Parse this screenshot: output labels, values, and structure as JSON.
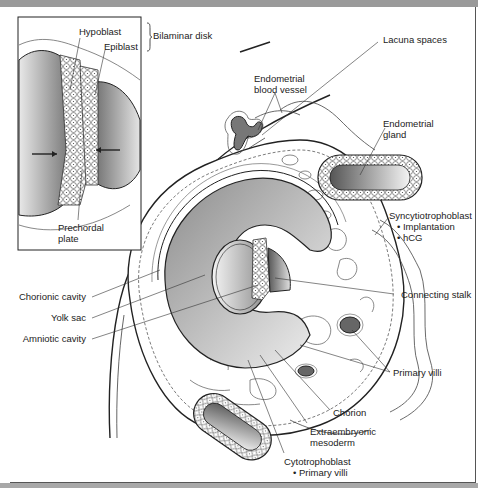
{
  "figure": {
    "inset": {
      "labels": {
        "hypoblast": "Hypoblast",
        "epiblast": "Epiblast",
        "bilaminar_disk": "Bilaminar disk",
        "prechordal_plate_line1": "Prechordal",
        "prechordal_plate_line2": "plate"
      }
    },
    "labels": {
      "lacuna_spaces": "Lacuna spaces",
      "endometrial_blood_vessel_line1": "Endometrial",
      "endometrial_blood_vessel_line2": "blood vessel",
      "endometrial_gland_line1": "Endometrial",
      "endometrial_gland_line2": "gland",
      "syncytiotrophoblast": "Syncytiotrophoblast",
      "syncytiotrophoblast_bullets": [
        "Implantation",
        "hCG"
      ],
      "chorionic_cavity": "Chorionic cavity",
      "yolk_sac": "Yolk sac",
      "amniotic_cavity": "Amniotic cavity",
      "connecting_stalk": "Connecting stalk",
      "primary_villi": "Primary villi",
      "chorion": "Chorion",
      "extraembryonic_mesoderm_line1": "Extraembryonic",
      "extraembryonic_mesoderm_line2": "mesoderm",
      "cytotrophoblast": "Cytotrophoblast",
      "cytotrophoblast_bullets": [
        "Primary villi"
      ]
    }
  }
}
